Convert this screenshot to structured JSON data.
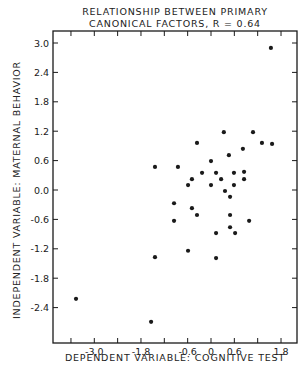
{
  "chart_data": {
    "type": "scatter",
    "title_lines": [
      "RELATIONSHIP BETWEEN PRIMARY",
      "CANONICAL FACTORS,  R = 0.64"
    ],
    "xlabel": "DEPENDENT VARIABLE: COGNITIVE TEST",
    "ylabel": "INDEPENDENT VARIABLE: MATERNAL BEHAVIOR",
    "xlim": [
      -4.0,
      2.2
    ],
    "ylim": [
      -3.2,
      3.2
    ],
    "x_ticks": [
      -3.6,
      -3.0,
      -2.4,
      -1.8,
      -1.2,
      -0.6,
      0.0,
      0.6,
      1.2,
      1.8
    ],
    "x_tick_labels": [
      {
        "value": -3.0,
        "label": "-3.0"
      },
      {
        "value": -1.8,
        "label": "-1.8"
      },
      {
        "value": -0.6,
        "label": "-0.6"
      },
      {
        "value": 0.0,
        "label": "0"
      },
      {
        "value": 0.6,
        "label": "0.6"
      },
      {
        "value": 1.8,
        "label": "1.8"
      }
    ],
    "y_ticks": [
      3.0,
      2.4,
      1.8,
      1.2,
      0.6,
      0.0,
      -0.6,
      -1.2,
      -1.8,
      -2.4
    ],
    "y_tick_labels": [
      {
        "value": 3.0,
        "label": "3.0"
      },
      {
        "value": 2.4,
        "label": "2.4"
      },
      {
        "value": 1.8,
        "label": "1.8"
      },
      {
        "value": 1.2,
        "label": "1.2"
      },
      {
        "value": 0.6,
        "label": "0.6"
      },
      {
        "value": 0.0,
        "label": "0.0"
      },
      {
        "value": -0.6,
        "label": "-0.6"
      },
      {
        "value": -1.2,
        "label": "-1.2"
      },
      {
        "value": -1.8,
        "label": "-1.8"
      },
      {
        "value": -2.4,
        "label": "-2.4"
      }
    ],
    "grid": false,
    "legend": null,
    "series": [
      {
        "name": "subjects",
        "points": [
          [
            1.54,
            2.9
          ],
          [
            1.08,
            1.18
          ],
          [
            0.33,
            1.18
          ],
          [
            1.31,
            0.96
          ],
          [
            1.57,
            0.94
          ],
          [
            -0.36,
            0.96
          ],
          [
            0.82,
            0.84
          ],
          [
            0.46,
            0.71
          ],
          [
            -1.44,
            0.47
          ],
          [
            -0.85,
            0.47
          ],
          [
            0.0,
            0.59
          ],
          [
            -0.23,
            0.35
          ],
          [
            0.13,
            0.35
          ],
          [
            0.59,
            0.35
          ],
          [
            0.85,
            0.37
          ],
          [
            -0.49,
            0.22
          ],
          [
            0.26,
            0.22
          ],
          [
            0.85,
            0.22
          ],
          [
            -0.59,
            0.1
          ],
          [
            0.0,
            0.1
          ],
          [
            0.59,
            0.1
          ],
          [
            0.36,
            -0.02
          ],
          [
            0.49,
            -0.14
          ],
          [
            -0.95,
            -0.27
          ],
          [
            -0.49,
            -0.37
          ],
          [
            -0.36,
            -0.51
          ],
          [
            0.49,
            -0.51
          ],
          [
            -0.95,
            -0.63
          ],
          [
            0.98,
            -0.63
          ],
          [
            0.49,
            -0.76
          ],
          [
            0.13,
            -0.88
          ],
          [
            0.62,
            -0.88
          ],
          [
            -0.59,
            -1.24
          ],
          [
            -1.44,
            -1.37
          ],
          [
            0.13,
            -1.39
          ],
          [
            -3.47,
            -2.22
          ],
          [
            -1.54,
            -2.69
          ]
        ]
      }
    ]
  },
  "colors": {
    "ink": "#1a1a1a",
    "background": "#ffffff"
  }
}
